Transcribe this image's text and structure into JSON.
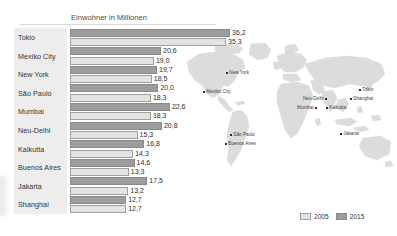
{
  "chart_data": {
    "type": "bar",
    "title": "Einwohner in Millionen",
    "xlabel": "",
    "ylabel": "",
    "orientation": "horizontal",
    "grid": false,
    "legend_position": "bottom-right",
    "xlim": [
      0,
      36.2
    ],
    "categories": [
      "Tokio",
      "Mexiko City",
      "New York",
      "São Paulo",
      "Mumbai",
      "Neu-Delhi",
      "Kalkutta",
      "Buenos Aires",
      "Jakarta",
      "Shanghai"
    ],
    "series": [
      {
        "name": "2015",
        "values": [
          36.2,
          20.6,
          19.7,
          20.0,
          22.6,
          20.8,
          16.8,
          14.6,
          17.5,
          12.7
        ],
        "labels": [
          "36,2",
          "20,6",
          "19,7",
          "20,0",
          "22,6",
          "20,8",
          "16,8",
          "14,6",
          "17,5",
          "12,7"
        ],
        "color": "#9d9d9d"
      },
      {
        "name": "2005",
        "values": [
          35.3,
          19.0,
          18.5,
          18.3,
          18.3,
          15.3,
          14.3,
          13.3,
          13.2,
          12.7
        ],
        "labels": [
          "35,3",
          "19,0",
          "18,5",
          "18,3",
          "18,3",
          "15,3",
          "14,3",
          "13,3",
          "13,2",
          "12,7"
        ],
        "color": "#e3e3e3"
      }
    ]
  },
  "legend": {
    "items": [
      {
        "label": "2005",
        "color": "#e3e3e3"
      },
      {
        "label": "2015",
        "color": "#9d9d9d"
      }
    ]
  },
  "map": {
    "cities": [
      {
        "name": "New York",
        "x": 41,
        "y": 30,
        "side": "right"
      },
      {
        "name": "Mexiko City",
        "x": 22,
        "y": 49,
        "side": "right"
      },
      {
        "name": "São Paulo",
        "x": 49,
        "y": 92,
        "side": "right"
      },
      {
        "name": "Buenos Aires",
        "x": 44,
        "y": 101,
        "side": "right"
      },
      {
        "name": "Neu-Delhi",
        "x": 141,
        "y": 56,
        "side": "right"
      },
      {
        "name": "Mumbai",
        "x": 133,
        "y": 65,
        "side": "right"
      },
      {
        "name": "Kalkutta",
        "x": 151,
        "y": 65,
        "side": "right"
      },
      {
        "name": "Tokio",
        "x": 177,
        "y": 47,
        "side": "right"
      },
      {
        "name": "Shanghai",
        "x": 168,
        "y": 56,
        "side": "right"
      },
      {
        "name": "Jakarta",
        "x": 158,
        "y": 91,
        "side": "right"
      }
    ]
  }
}
